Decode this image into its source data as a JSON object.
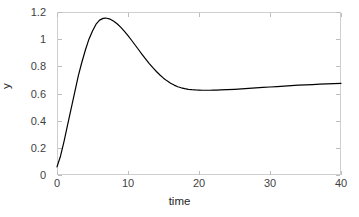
{
  "chart_data": {
    "type": "line",
    "title": "",
    "xlabel": "time",
    "ylabel": "y",
    "xlim": [
      0,
      40
    ],
    "ylim": [
      0,
      1.2
    ],
    "xticks": [
      0,
      10,
      20,
      30,
      40
    ],
    "yticks": [
      0,
      0.2,
      0.4,
      0.6,
      0.8,
      1,
      1.2
    ],
    "xticklabels": [
      "0",
      "10",
      "20",
      "30",
      "40"
    ],
    "yticklabels": [
      "0",
      "0.2",
      "0.4",
      "0.6",
      "0.8",
      "1",
      "1.2"
    ],
    "grid": false,
    "legend": null,
    "line_color": "#000000",
    "line_width": 1.2,
    "series": [
      {
        "name": "y",
        "x": [
          0.0,
          0.5,
          1.0,
          1.5,
          2.0,
          2.5,
          3.0,
          3.5,
          4.0,
          4.5,
          5.0,
          5.5,
          6.0,
          6.5,
          6.8,
          7.0,
          7.5,
          8.0,
          8.5,
          9.0,
          9.5,
          10.0,
          10.5,
          11.0,
          11.5,
          12.0,
          12.5,
          13.0,
          13.5,
          14.0,
          14.5,
          15.0,
          15.5,
          16.0,
          16.5,
          17.0,
          17.5,
          18.0,
          18.5,
          19.0,
          19.5,
          20.0,
          20.5,
          21.0,
          21.5,
          22.0,
          22.5,
          23.0,
          24.0,
          25.0,
          26.0,
          27.0,
          28.0,
          29.0,
          30.0,
          31.0,
          32.0,
          33.0,
          34.0,
          35.0,
          36.0,
          37.0,
          38.0,
          39.0,
          40.0
        ],
        "y": [
          0.06,
          0.14,
          0.25,
          0.37,
          0.49,
          0.61,
          0.73,
          0.83,
          0.92,
          1.0,
          1.06,
          1.11,
          1.14,
          1.153,
          1.155,
          1.154,
          1.147,
          1.132,
          1.112,
          1.087,
          1.058,
          1.026,
          0.992,
          0.957,
          0.922,
          0.887,
          0.853,
          0.82,
          0.79,
          0.762,
          0.736,
          0.713,
          0.693,
          0.676,
          0.662,
          0.65,
          0.642,
          0.636,
          0.631,
          0.628,
          0.626,
          0.625,
          0.624,
          0.624,
          0.624,
          0.625,
          0.625,
          0.626,
          0.628,
          0.631,
          0.634,
          0.638,
          0.641,
          0.645,
          0.648,
          0.651,
          0.655,
          0.658,
          0.661,
          0.663,
          0.666,
          0.669,
          0.671,
          0.673,
          0.675
        ]
      }
    ]
  }
}
